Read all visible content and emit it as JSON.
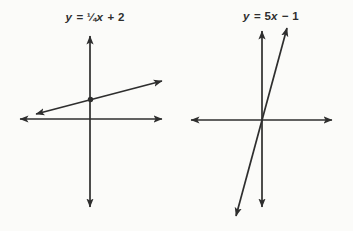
{
  "figure": {
    "background": "#fbfbf9",
    "ink": "#2e2e2e",
    "stroke_width": 1.7,
    "width": 353,
    "height": 231
  },
  "panels": [
    {
      "name": "left-graph",
      "equation_text": "y = ¼x + 2",
      "label_segments": [
        {
          "t": "y",
          "i": true
        },
        {
          "t": " = ¼",
          "i": false
        },
        {
          "t": "x",
          "i": true
        },
        {
          "t": " + 2",
          "i": false
        }
      ],
      "geometry": {
        "x_axis": {
          "x1": 20,
          "y1": 119,
          "x2": 162,
          "y2": 119
        },
        "y_axis": {
          "x1": 90,
          "y1": 36,
          "x2": 90,
          "y2": 207
        },
        "func_line": {
          "x1": 36,
          "y1": 114,
          "x2": 162,
          "y2": 81
        },
        "dot": {
          "cx": 90.5,
          "cy": 99.5,
          "r": 2.7
        }
      }
    },
    {
      "name": "right-graph",
      "equation_text": "y = 5x − 1",
      "label_segments": [
        {
          "t": "y",
          "i": true
        },
        {
          "t": " = 5",
          "i": false
        },
        {
          "t": "x",
          "i": true
        },
        {
          "t": " − 1",
          "i": false
        }
      ],
      "geometry": {
        "x_axis": {
          "x1": 191,
          "y1": 120,
          "x2": 332,
          "y2": 120
        },
        "y_axis": {
          "x1": 262,
          "y1": 31,
          "x2": 262,
          "y2": 207
        },
        "func_line": {
          "x1": 236,
          "y1": 216,
          "x2": 287,
          "y2": 28
        },
        "dot": null
      }
    }
  ],
  "chart_data": [
    {
      "type": "line",
      "title": "y = ¼x + 2",
      "equation": "y = (1/4)x + 2",
      "slope": 0.25,
      "y_intercept": 2,
      "marked_points": [
        {
          "x": 0,
          "y": 2,
          "note": "solid dot at y-intercept"
        }
      ],
      "axes": {
        "xlabel": "",
        "ylabel": "",
        "ticks": "none",
        "style": "schematic axes with arrowheads on all four ends"
      },
      "line_style": "straight line with arrowheads on both ends, shallow positive slope",
      "grid": false,
      "legend": "none"
    },
    {
      "type": "line",
      "title": "y = 5x − 1",
      "equation": "y = 5x − 1",
      "slope": 5,
      "y_intercept": -1,
      "marked_points": [],
      "axes": {
        "xlabel": "",
        "ylabel": "",
        "ticks": "none",
        "style": "schematic axes with arrowheads on all four ends"
      },
      "line_style": "straight line with arrowheads on both ends, steep positive slope passing just beside the origin",
      "grid": false,
      "legend": "none"
    }
  ]
}
